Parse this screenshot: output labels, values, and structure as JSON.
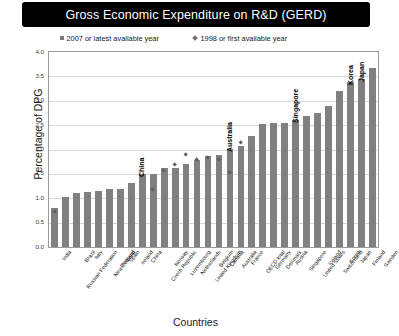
{
  "title": "Gross Economic Expenditure on R&D (GERD)",
  "legend": {
    "series_2007": "2007 or latest available year",
    "series_1998": "1998 or first available year"
  },
  "axes": {
    "ylabel": "Percentage of DPG",
    "xlabel": "Countries",
    "yticks": [
      "0.0",
      "0.5",
      "1.0",
      "1.5",
      "2.0",
      "2.5",
      "3.0",
      "3.5",
      "4.0"
    ]
  },
  "colors": {
    "bar": "#808080",
    "marker": "#5e5e5e",
    "title_banner": "#000000",
    "title_text": "#ffffff",
    "gridline": "#d8d8d8",
    "frame": "#9a9a9a"
  },
  "annotations": [
    {
      "label": "China",
      "index": 8
    },
    {
      "label": "Australia",
      "index": 16
    },
    {
      "label": "Singapore",
      "index": 22
    },
    {
      "label": "Korea",
      "index": 27
    },
    {
      "label": "Japan",
      "index": 28
    }
  ],
  "chart_data": {
    "type": "bar",
    "title": "Gross Economic Expenditure on R&D (GERD)",
    "xlabel": "Countries",
    "ylabel": "Percentage of DPG",
    "ylim": [
      0.0,
      4.0
    ],
    "ytick_step": 0.5,
    "grid": true,
    "legend_position": "top",
    "categories": [
      "India",
      "Russian Federation",
      "Brazil",
      "Italy",
      "New Zealand",
      "Portugal",
      "Spain",
      "Ireland",
      "China",
      "Czech Republic",
      "Norway",
      "Luxembourg",
      "Netherlands",
      "United Kingdom",
      "Belgium",
      "Canada",
      "Australia",
      "France",
      "OECD total",
      "Germany",
      "Denmark",
      "Austria",
      "Singapore",
      "United States",
      "Iceland",
      "Switzerland",
      "Korea",
      "Japan",
      "Finland",
      "Sweden"
    ],
    "series": [
      {
        "name": "2007 or latest available year",
        "marker": "bar",
        "values": [
          0.8,
          1.03,
          1.1,
          1.13,
          1.15,
          1.18,
          1.2,
          1.32,
          1.49,
          1.5,
          1.62,
          1.63,
          1.7,
          1.79,
          1.87,
          1.88,
          2.01,
          2.08,
          2.28,
          2.53,
          2.55,
          2.55,
          2.61,
          2.68,
          2.75,
          2.9,
          3.21,
          3.39,
          3.45,
          3.68
        ]
      },
      {
        "name": "1998 or first available year",
        "marker": "diamond",
        "values": [
          0.73,
          null,
          null,
          null,
          null,
          null,
          null,
          null,
          null,
          1.18,
          1.57,
          1.68,
          1.9,
          1.79,
          1.84,
          1.8,
          1.52,
          2.14,
          null,
          null,
          null,
          null,
          null,
          null,
          null,
          null,
          null,
          null,
          null,
          null
        ]
      }
    ]
  }
}
